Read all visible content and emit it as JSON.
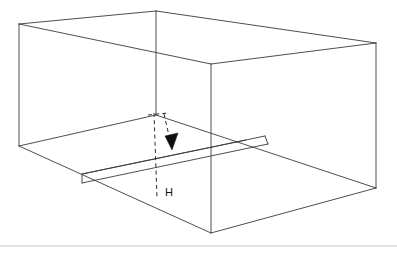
{
  "figure": {
    "background_color": "#ffffff",
    "line_color": "#3a3a3a",
    "dashed_color": "#2c2c2c",
    "arrow_color": "#101010",
    "footer_rule_color": "#c6c6c6",
    "labels": {
      "height": "H"
    },
    "label_positions": {
      "height": {
        "x": 169,
        "y": 193
      }
    },
    "vertices": {
      "top_front_left": {
        "x": 19,
        "y": 24
      },
      "top_back_left": {
        "x": 156,
        "y": 11
      },
      "top_back_right": {
        "x": 376,
        "y": 43
      },
      "top_inner_corner": {
        "x": 211,
        "y": 64
      },
      "bottom_front_left": {
        "x": 19,
        "y": 146
      },
      "bottom_back_left": {
        "x": 156,
        "y": 115
      },
      "bottom_inner_corner": {
        "x": 211,
        "y": 233
      },
      "bottom_back_right": {
        "x": 376,
        "y": 188
      },
      "floor_band_left": {
        "x": 82,
        "y": 174
      }
    },
    "dashed_arrow": {
      "start": {
        "x": 156,
        "y": 114
      },
      "bend": {
        "x": 157,
        "y": 198
      },
      "arrow_start": {
        "x": 163,
        "y": 114
      },
      "arrow_tip": {
        "x": 171,
        "y": 150
      }
    },
    "footer_rule": {
      "x1": 0,
      "y1": 246,
      "x2": 397,
      "y2": 246
    }
  },
  "canvas": {
    "width": 397,
    "height": 253
  }
}
